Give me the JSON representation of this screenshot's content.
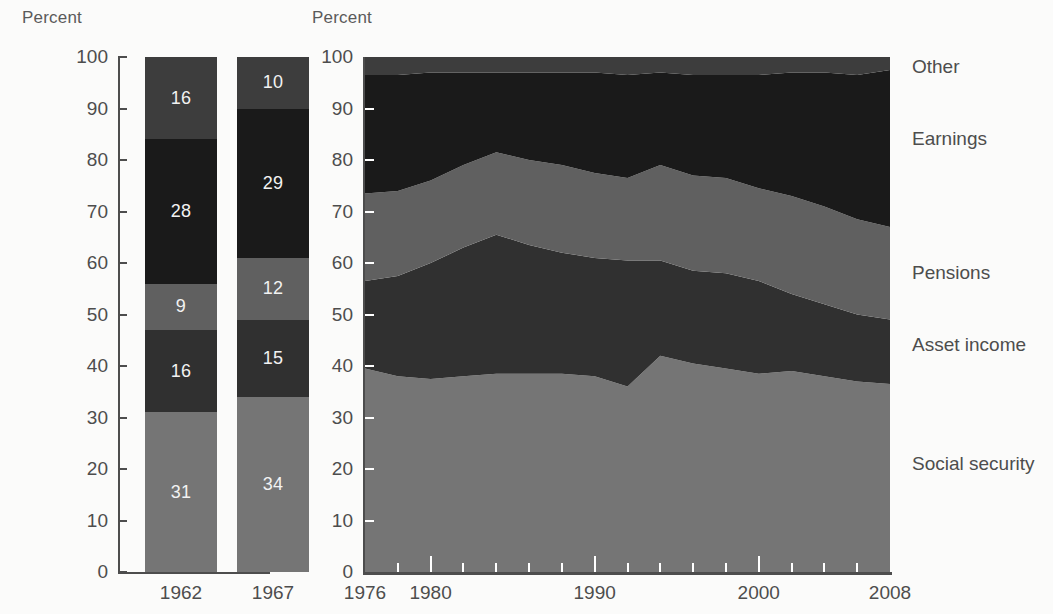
{
  "chart_data": [
    {
      "type": "bar",
      "title": "",
      "ylabel": "Percent",
      "xlabel": "",
      "ylim": [
        0,
        100
      ],
      "yticks": [
        0,
        10,
        20,
        30,
        40,
        50,
        60,
        70,
        80,
        90,
        100
      ],
      "categories": [
        "1962",
        "1967"
      ],
      "stacked": true,
      "grid": false,
      "legend_position": "right-of-area-chart",
      "series": [
        {
          "name": "Social security",
          "color": "#757575",
          "values": [
            31,
            34
          ]
        },
        {
          "name": "Asset income",
          "color": "#303030",
          "values": [
            16,
            15
          ]
        },
        {
          "name": "Pensions",
          "color": "#606060",
          "values": [
            9,
            12
          ]
        },
        {
          "name": "Earnings",
          "color": "#1a1a1a",
          "values": [
            28,
            29
          ]
        },
        {
          "name": "Other",
          "color": "#3d3d3d",
          "values": [
            16,
            10
          ]
        }
      ]
    },
    {
      "type": "area",
      "title": "",
      "ylabel": "Percent",
      "xlabel": "",
      "ylim": [
        0,
        100
      ],
      "yticks": [
        0,
        10,
        20,
        30,
        40,
        50,
        60,
        70,
        80,
        90,
        100
      ],
      "xlim": [
        1976,
        2008
      ],
      "xticks_labeled": [
        "1976",
        "1980",
        "1990",
        "2000",
        "2008"
      ],
      "xticks_minor_every": 2,
      "stacked": true,
      "grid": false,
      "legend_position": "right",
      "x": [
        1976,
        1978,
        1980,
        1982,
        1984,
        1986,
        1988,
        1990,
        1992,
        1994,
        1996,
        1998,
        2000,
        2002,
        2004,
        2006,
        2008
      ],
      "series": [
        {
          "name": "Social security",
          "color": "#757575",
          "values": [
            39.5,
            38.0,
            37.5,
            38.0,
            38.5,
            38.5,
            38.5,
            38.0,
            36.0,
            42.0,
            40.5,
            39.5,
            38.5,
            39.0,
            38.0,
            37.0,
            36.5
          ]
        },
        {
          "name": "Asset income",
          "color": "#303030",
          "values": [
            17.0,
            19.5,
            22.5,
            25.0,
            27.0,
            25.0,
            23.5,
            23.0,
            24.5,
            18.5,
            18.0,
            18.5,
            18.0,
            15.0,
            14.0,
            13.0,
            12.5
          ]
        },
        {
          "name": "Pensions",
          "color": "#606060",
          "values": [
            17.0,
            16.5,
            16.0,
            16.0,
            16.0,
            16.5,
            17.0,
            16.5,
            16.0,
            18.5,
            18.5,
            18.5,
            18.0,
            19.0,
            19.0,
            18.5,
            18.0
          ]
        },
        {
          "name": "Earnings",
          "color": "#1a1a1a",
          "values": [
            23.0,
            22.5,
            21.0,
            18.0,
            15.5,
            17.0,
            18.0,
            19.5,
            20.0,
            18.0,
            19.5,
            20.0,
            22.0,
            24.0,
            26.0,
            28.0,
            30.5
          ]
        },
        {
          "name": "Other",
          "color": "#3d3d3d",
          "values": [
            3.5,
            3.5,
            3.0,
            3.0,
            3.0,
            3.0,
            3.0,
            3.0,
            3.5,
            3.0,
            3.5,
            3.5,
            3.5,
            3.0,
            3.0,
            3.5,
            2.5
          ]
        }
      ]
    }
  ],
  "bar_panel": {
    "axis_title": "Percent",
    "y_ticks": [
      "100",
      "90",
      "80",
      "70",
      "60",
      "50",
      "40",
      "30",
      "20",
      "10",
      "0"
    ],
    "bars": [
      {
        "category": "1962",
        "segments": [
          {
            "label": "16",
            "series": "Other",
            "value": 16,
            "bottom": 84,
            "color": "#3d3d3d"
          },
          {
            "label": "28",
            "series": "Earnings",
            "value": 28,
            "bottom": 56,
            "color": "#1a1a1a"
          },
          {
            "label": "9",
            "series": "Pensions",
            "value": 9,
            "bottom": 47,
            "color": "#606060"
          },
          {
            "label": "16",
            "series": "Asset income",
            "value": 16,
            "bottom": 31,
            "color": "#303030"
          },
          {
            "label": "31",
            "series": "Social security",
            "value": 31,
            "bottom": 0,
            "color": "#757575"
          }
        ]
      },
      {
        "category": "1967",
        "segments": [
          {
            "label": "10",
            "series": "Other",
            "value": 10,
            "bottom": 90,
            "color": "#3d3d3d"
          },
          {
            "label": "29",
            "series": "Earnings",
            "value": 29,
            "bottom": 61,
            "color": "#1a1a1a"
          },
          {
            "label": "12",
            "series": "Pensions",
            "value": 12,
            "bottom": 49,
            "color": "#606060"
          },
          {
            "label": "15",
            "series": "Asset income",
            "value": 15,
            "bottom": 34,
            "color": "#303030"
          },
          {
            "label": "34",
            "series": "Social security",
            "value": 34,
            "bottom": 0,
            "color": "#757575"
          }
        ]
      }
    ]
  },
  "area_panel": {
    "axis_title": "Percent",
    "y_ticks": [
      "100",
      "90",
      "80",
      "70",
      "60",
      "50",
      "40",
      "30",
      "20",
      "10",
      "0"
    ],
    "x_ticks": [
      "1976",
      "1980",
      "1990",
      "2000",
      "2008"
    ],
    "legend": [
      {
        "label": "Other",
        "color": "#3d3d3d",
        "at_percent": 98
      },
      {
        "label": "Earnings",
        "color": "#1a1a1a",
        "at_percent": 84
      },
      {
        "label": "Pensions",
        "color": "#606060",
        "at_percent": 58
      },
      {
        "label": "Asset income",
        "color": "#303030",
        "at_percent": 44
      },
      {
        "label": "Social security",
        "color": "#757575",
        "at_percent": 21
      }
    ]
  }
}
